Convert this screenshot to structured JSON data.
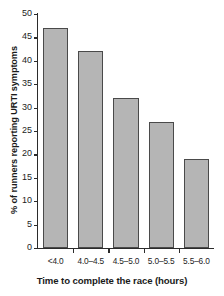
{
  "chart_data": {
    "type": "bar",
    "title": "",
    "categories": [
      "<4.0",
      "4.0–4.5",
      "4.5–5.0",
      "5.0–5.5",
      "5.5–6.0"
    ],
    "values": [
      47,
      42,
      32,
      27,
      19
    ],
    "xlabel": "Time to complete the race (hours)",
    "ylabel": "% of runners reporting URTI symptoms",
    "ylim": [
      0,
      50
    ],
    "ytick_labels": [
      "0",
      "5",
      "10",
      "15",
      "20",
      "25",
      "30",
      "35",
      "40",
      "45",
      "50"
    ],
    "ytick_values": [
      0,
      5,
      10,
      15,
      20,
      25,
      30,
      35,
      40,
      45,
      50
    ],
    "grid": false,
    "legend": null,
    "bar_color": "#b5b5b5",
    "bar_edge_color": "#4a4a4a",
    "axis_color": "#2b2b2b",
    "background": "#ffffff"
  }
}
